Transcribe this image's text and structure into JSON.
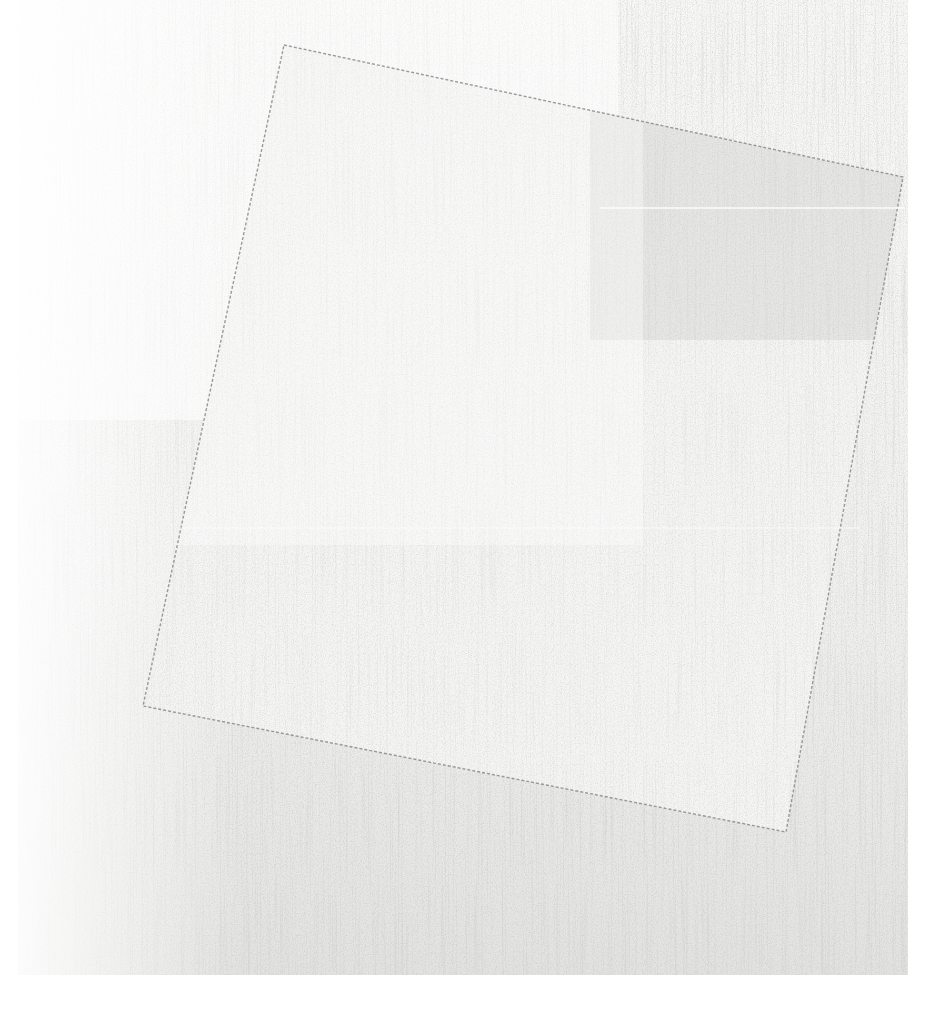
{
  "artwork": {
    "subject": "white square tilted on white ground",
    "colors": {
      "page_background": "#ffffff",
      "canvas_ground": "#ececea",
      "canvas_ground_light": "#f7f7f6",
      "square_fill": "#f3f3f2",
      "square_shade": "#dedddc",
      "edge_line": "#8a8a88"
    },
    "canvas_bounds": {
      "x": 18,
      "y": 0,
      "width": 890,
      "height": 975
    },
    "square_corners": [
      [
        284,
        45
      ],
      [
        903,
        177
      ],
      [
        786,
        832
      ],
      [
        143,
        706
      ]
    ]
  }
}
